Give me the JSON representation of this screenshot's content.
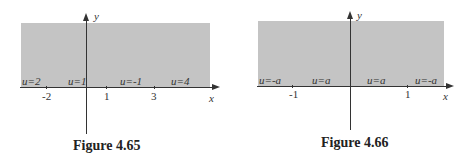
{
  "figures": [
    {
      "caption": "Figure 4.65",
      "x_axis_label": "x",
      "y_axis_label": "y",
      "boundary_labels": [
        "u=2",
        "u=1",
        "u=-1",
        "u=4"
      ],
      "ticks": [
        "-2",
        "1",
        "3"
      ]
    },
    {
      "caption": "Figure 4.66",
      "x_axis_label": "x",
      "y_axis_label": "y",
      "boundary_labels": [
        "u=-a",
        "u=a",
        "u=a",
        "u=-a"
      ],
      "ticks": [
        "-1",
        "1"
      ]
    }
  ],
  "colors": {
    "shade": "#c4c4c4",
    "axis": "#333333"
  }
}
